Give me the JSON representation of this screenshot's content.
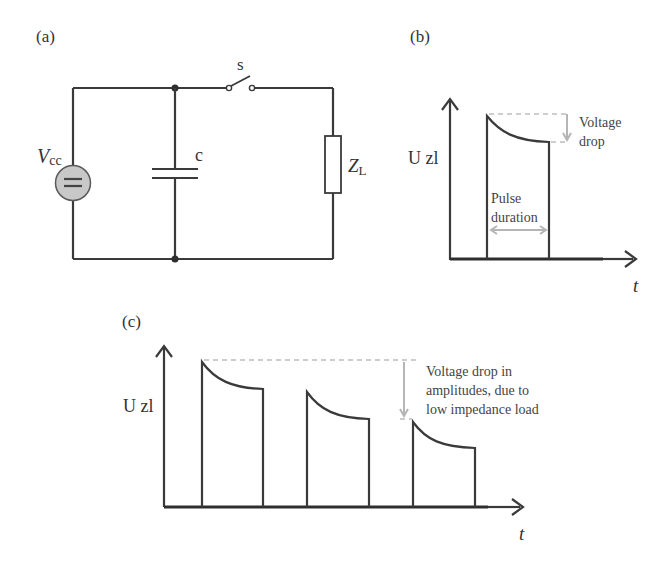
{
  "figure": {
    "panels": [
      {
        "id": "a",
        "label": "(a)"
      },
      {
        "id": "b",
        "label": "(b)"
      },
      {
        "id": "c",
        "label": "(c)"
      }
    ]
  },
  "circuit": {
    "source_label_main": "V",
    "source_label_sub": "cc",
    "capacitor_label": "c",
    "switch_label": "s",
    "load_label_main": "Z",
    "load_label_sub": "L",
    "colors": {
      "wire": "#3a3a3a",
      "source_fill": "#c8c8c8"
    }
  },
  "single_pulse": {
    "y_axis_label": "U zl",
    "x_axis_label": "t",
    "annotation_drop_line1": "Voltage",
    "annotation_drop_line2": "drop",
    "annotation_duration_line1": "Pulse",
    "annotation_duration_line2": "duration",
    "colors": {
      "annotation": "#b5b5b5"
    }
  },
  "pulse_train": {
    "y_axis_label": "U zl",
    "x_axis_label": "t",
    "annotation_line1": "Voltage drop in",
    "annotation_line2": "amplitudes, due to",
    "annotation_line3": "low impedance load",
    "pulses": [
      {
        "start_peak": 1.0,
        "end_level": 0.73
      },
      {
        "start_peak": 0.79,
        "end_level": 0.57
      },
      {
        "start_peak": 0.59,
        "end_level": 0.4
      }
    ]
  }
}
